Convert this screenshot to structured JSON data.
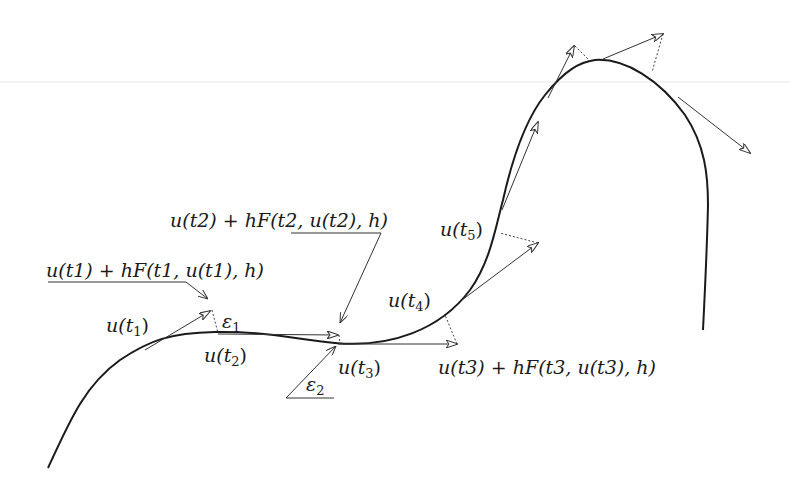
{
  "diagram": {
    "type": "numerical-integration-one-step-method",
    "curve": {
      "label": "u(t)",
      "start": [
        48,
        468
      ],
      "end": [
        703,
        330
      ]
    },
    "labels": {
      "u_t1": {
        "base": "u(t",
        "sub": "1",
        "close": ")"
      },
      "u_t2": {
        "base": "u(t",
        "sub": "2",
        "close": ")"
      },
      "u_t3": {
        "base": "u(t",
        "sub": "3",
        "close": ")"
      },
      "u_t4": {
        "base": "u(t",
        "sub": "4",
        "close": ")"
      },
      "u_t5": {
        "base": "u(t",
        "sub": "5",
        "close": ")"
      },
      "eps1": {
        "base": "ε",
        "sub": "1"
      },
      "eps2": {
        "base": "ε",
        "sub": "2"
      },
      "step1": "u(t1) + hF(t1, u(t1), h)",
      "step2": "u(t2) + hF(t2, u(t2), h)",
      "step3": "u(t3) + hF(t3, u(t3), h)"
    },
    "colors": {
      "curve": "#1a1a1a",
      "arrow": "#333333",
      "dotted": "#444444",
      "faint_line": "#e6e6e6"
    }
  }
}
